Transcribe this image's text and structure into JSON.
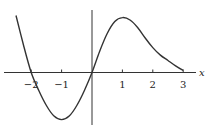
{
  "chart_data": {
    "type": "line",
    "title": "",
    "xlabel": "x",
    "ylabel": "",
    "xlim": [
      -2.6,
      3.3
    ],
    "ylim": [
      -1.8,
      2.1
    ],
    "grid": false,
    "legend": null,
    "x_ticks": [
      -2,
      -1,
      1,
      2,
      3
    ],
    "x_tick_labels": [
      "−2",
      "−1",
      "1",
      "2",
      "3"
    ],
    "y_ticks": [],
    "series": [
      {
        "name": "f(x)",
        "x": [
          -2.5,
          -2.25,
          -2,
          -1.75,
          -1.5,
          -1.25,
          -1,
          -0.75,
          -0.5,
          -0.25,
          0,
          0.25,
          0.5,
          0.75,
          1,
          1.25,
          1.5,
          1.75,
          2,
          2.25,
          2.5,
          2.75,
          3
        ],
        "y": [
          1.9,
          0.9,
          0,
          -0.6,
          -1.1,
          -1.45,
          -1.57,
          -1.45,
          -1.1,
          -0.6,
          0,
          0.7,
          1.3,
          1.7,
          1.83,
          1.75,
          1.5,
          1.15,
          0.83,
          0.58,
          0.4,
          0.22,
          0.07
        ]
      }
    ],
    "annotations": {
      "zeros": [
        -2,
        0
      ],
      "local_min": {
        "x": -1,
        "y": -1.57
      },
      "local_max": {
        "x": 1,
        "y": 1.83
      }
    }
  },
  "labels": {
    "x_axis": "x",
    "ticks": [
      "−2",
      "−1",
      "1",
      "2",
      "3"
    ]
  }
}
